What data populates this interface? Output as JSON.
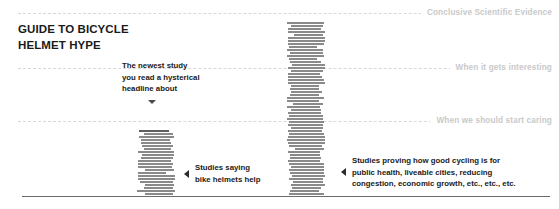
{
  "title": {
    "lines": [
      "GUIDE TO BICYCLE",
      "HELMET HYPE"
    ]
  },
  "reference_lines": [
    {
      "label": "Conclusive Scientific Evidence"
    },
    {
      "label": "When it gets interesting"
    },
    {
      "label": "When we should start caring"
    }
  ],
  "annotations": {
    "mid": {
      "lines": [
        "The newest study",
        "you read a hysterical",
        "headline about"
      ],
      "marker": "triangle-down-icon"
    },
    "helmets": {
      "marker": "triangle-left-icon",
      "lines": [
        "Studies saying",
        "bike helmets help"
      ]
    },
    "cycling": {
      "marker": "triangle-left-icon",
      "lines": [
        "Studies proving how good cycling is for",
        "public health, liveable cities, reducing",
        "congestion, economic growth, etc., etc., etc."
      ]
    }
  },
  "colors": {
    "bar": "#8a8a8a",
    "bar_cap": "#5e5e5e",
    "reference_line": "#d8d8d8",
    "reference_label": "#c9c9c9",
    "baseline": "#6b6b6b",
    "text": "#1a1a1a",
    "background": "#ffffff"
  },
  "chart_data": {
    "type": "bar",
    "title": "GUIDE TO BICYCLE HELMET HYPE",
    "xlabel": "",
    "ylabel": "",
    "grid": true,
    "legend_position": "none",
    "categories": [
      "Studies saying bike helmets help",
      "Studies proving how good cycling is for public health, liveable cities, reducing congestion, economic growth, etc., etc., etc."
    ],
    "values": [
      63,
      174
    ],
    "ylim": [
      0,
      190
    ],
    "gridlines": [
      {
        "value": 174,
        "label": "Conclusive Scientific Evidence"
      },
      {
        "value": 126,
        "label": "When it gets interesting"
      },
      {
        "value": 73,
        "label": "When we should start caring"
      }
    ],
    "annotations": [
      {
        "text": "The newest study you read a hysterical headline about",
        "points_to": "Studies saying bike helmets help"
      }
    ],
    "note": "Bars drawn as stacks of ragged horizontal stripes, each stripe representing one study."
  },
  "bar_render": {
    "short": {
      "stripe_count": 21,
      "top_cap": true
    },
    "tall": {
      "stripe_count": 58,
      "top_cap": false
    }
  }
}
